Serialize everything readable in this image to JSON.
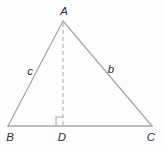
{
  "figure": {
    "type": "geometry-diagram",
    "vertex_labels": {
      "A": "A",
      "B": "B",
      "C": "C",
      "D": "D"
    },
    "side_labels": {
      "ab_side": "c",
      "ac_side": "b"
    },
    "colors": {
      "background": "#fdfdfd",
      "line": "#a8a8a8",
      "altitude_line": "#b0b0b0",
      "label_ink": "#2d2d2d"
    }
  }
}
